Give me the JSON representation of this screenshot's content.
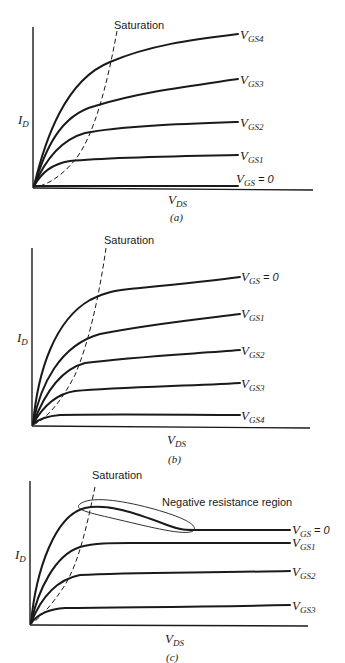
{
  "figure": {
    "panels": [
      {
        "id": "a",
        "caption": "(a)",
        "y_axis_label": {
          "main": "I",
          "sub": "D"
        },
        "x_axis_label": {
          "main": "V",
          "sub": "DS"
        },
        "saturation_label": "Saturation",
        "curves": [
          {
            "main": "V",
            "sub": "GS4",
            "suffix": ""
          },
          {
            "main": "V",
            "sub": "GS3",
            "suffix": ""
          },
          {
            "main": "V",
            "sub": "GS2",
            "suffix": ""
          },
          {
            "main": "V",
            "sub": "GS1",
            "suffix": ""
          },
          {
            "main": "V",
            "sub": "GS",
            "suffix": " = 0"
          }
        ]
      },
      {
        "id": "b",
        "caption": "(b)",
        "y_axis_label": {
          "main": "I",
          "sub": "D"
        },
        "x_axis_label": {
          "main": "V",
          "sub": "DS"
        },
        "saturation_label": "Saturation",
        "curves": [
          {
            "main": "V",
            "sub": "GS",
            "suffix": " = 0"
          },
          {
            "main": "V",
            "sub": "GS1",
            "suffix": ""
          },
          {
            "main": "V",
            "sub": "GS2",
            "suffix": ""
          },
          {
            "main": "V",
            "sub": "GS3",
            "suffix": ""
          },
          {
            "main": "V",
            "sub": "GS4",
            "suffix": ""
          }
        ]
      },
      {
        "id": "c",
        "caption": "(c)",
        "y_axis_label": {
          "main": "I",
          "sub": "D"
        },
        "x_axis_label": {
          "main": "V",
          "sub": "DS"
        },
        "saturation_label": "Saturation",
        "annotation": "Negative resistance region",
        "curves": [
          {
            "main": "V",
            "sub": "GS",
            "suffix": " = 0"
          },
          {
            "main": "V",
            "sub": "GS1",
            "suffix": ""
          },
          {
            "main": "V",
            "sub": "GS2",
            "suffix": ""
          },
          {
            "main": "V",
            "sub": "GS3",
            "suffix": ""
          }
        ]
      }
    ]
  }
}
